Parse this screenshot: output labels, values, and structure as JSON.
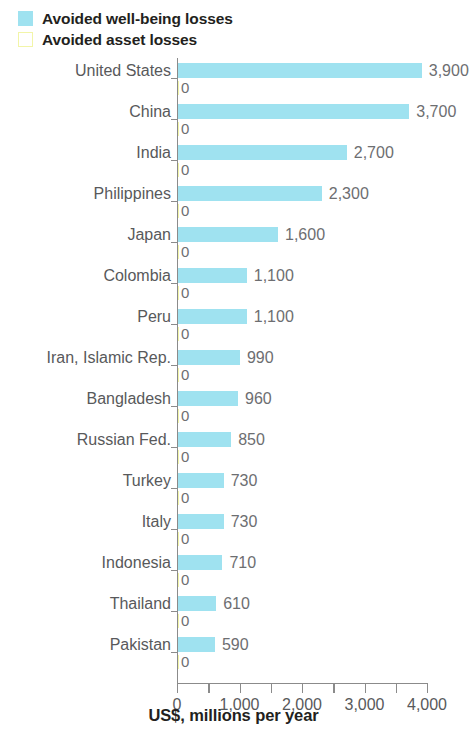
{
  "legend": {
    "items": [
      {
        "label": "Avoided well-being losses",
        "swatch": "filled",
        "color": "#9fe2f0",
        "icon": "legend-swatch-icon"
      },
      {
        "label": "Avoided asset losses",
        "swatch": "outlined",
        "color": "#f2f5a8",
        "icon": "legend-swatch-icon"
      }
    ]
  },
  "axis": {
    "x_title": "US$, millions per year",
    "x_ticks_major": [
      "0",
      "1,000",
      "2,000",
      "3,000",
      "4,000"
    ],
    "x_min": 0,
    "x_max": 4000
  },
  "chart_data": {
    "type": "bar",
    "orientation": "horizontal",
    "title": "",
    "subtitle": "",
    "xlabel": "US$, millions per year",
    "ylabel": "",
    "xlim": [
      0,
      4000
    ],
    "xticks": [
      0,
      500,
      1000,
      1500,
      2000,
      2500,
      3000,
      3500,
      4000
    ],
    "xticklabels": [
      "0",
      "",
      "1,000",
      "",
      "2,000",
      "",
      "3,000",
      "",
      "4,000"
    ],
    "grid": false,
    "legend_position": "top-left",
    "categories": [
      "United States",
      "China",
      "India",
      "Philippines",
      "Japan",
      "Colombia",
      "Peru",
      "Iran, Islamic Rep.",
      "Bangladesh",
      "Russian Fed.",
      "Turkey",
      "Italy",
      "Indonesia",
      "Thailand",
      "Pakistan"
    ],
    "series": [
      {
        "name": "Avoided well-being losses",
        "color": "#9fe2f0",
        "values": [
          3900,
          3700,
          2700,
          2300,
          1600,
          1100,
          1100,
          990,
          960,
          850,
          730,
          730,
          710,
          610,
          590
        ],
        "labels": [
          "3,900",
          "3,700",
          "2,700",
          "2,300",
          "1,600",
          "1,100",
          "1,100",
          "990",
          "960",
          "850",
          "730",
          "730",
          "710",
          "610",
          "590"
        ]
      },
      {
        "name": "Avoided asset losses",
        "color": "#f2f5a8",
        "values": [
          0,
          0,
          0,
          0,
          0,
          0,
          0,
          0,
          0,
          0,
          0,
          0,
          0,
          0,
          0
        ],
        "labels": [
          "0",
          "0",
          "0",
          "0",
          "0",
          "0",
          "0",
          "0",
          "0",
          "0",
          "0",
          "0",
          "0",
          "0",
          "0"
        ]
      }
    ]
  }
}
